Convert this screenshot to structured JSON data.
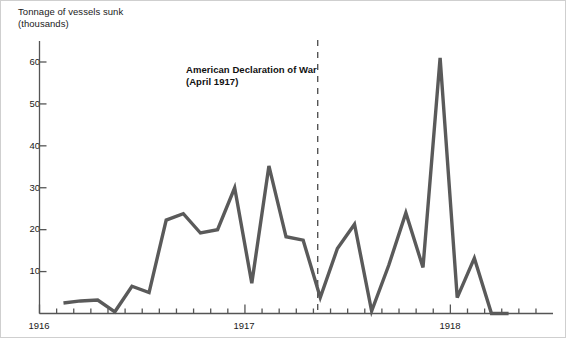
{
  "figure": {
    "width": 566,
    "height": 338,
    "background": "#ffffff",
    "axis_color": "#555555",
    "line_color": "#5a5a5a",
    "text_color": "#1a1a1a",
    "frame_color": "#cfcfcf"
  },
  "axis_title": "Tonnage of vessels sunk\n(thousands)",
  "annotation": {
    "text": "American Declaration of War\n(April 1917)",
    "marker": "dashed-vertical-line",
    "at_x_value": 16.25
  },
  "y_axis": {
    "labels": [
      "60",
      "50",
      "40",
      "30",
      "20",
      "10"
    ],
    "values": [
      60,
      50,
      40,
      30,
      20,
      10
    ]
  },
  "x_axis": {
    "labels": [
      "1916",
      "1917",
      "1918"
    ],
    "values": [
      0,
      12,
      24
    ]
  },
  "chart_data": {
    "type": "line",
    "title": "",
    "xlabel": "",
    "ylabel": "Tonnage of vessels sunk (thousands)",
    "ylim": [
      0,
      65
    ],
    "xlim": [
      0,
      29
    ],
    "grid": false,
    "legend": null,
    "annotations": [
      {
        "label": "American Declaration of War (April 1917)",
        "x": 16.25,
        "style": "dashed vertical line"
      }
    ],
    "x_tick_labels": [
      "1916",
      "1917",
      "1918"
    ],
    "x_tick_values": [
      0,
      12,
      24
    ],
    "y_tick_labels": [
      "10",
      "20",
      "30",
      "40",
      "50",
      "60"
    ],
    "y_tick_values": [
      10,
      20,
      30,
      40,
      50,
      60
    ],
    "series": [
      {
        "name": "Tonnage of vessels sunk (thousands)",
        "x": [
          1.4,
          2.4,
          3.4,
          4.4,
          5.4,
          6.4,
          7.4,
          8.4,
          9.4,
          10.4,
          11.4,
          12.4,
          13.4,
          14.4,
          15.4,
          16.4,
          17.4,
          18.4,
          19.4,
          20.4,
          21.4,
          22.4,
          23.4,
          24.4,
          25.4,
          26.4,
          27.4
        ],
        "values": [
          2.5,
          3.0,
          3.2,
          0.4,
          6.5,
          5.0,
          22.3,
          23.8,
          19.2,
          20.0,
          30.0,
          7.2,
          35.2,
          18.3,
          17.5,
          3.8,
          15.5,
          21.3,
          0.6,
          11.5,
          24.0,
          11.0,
          61.0,
          3.8,
          13.2,
          0.0,
          0.0
        ]
      }
    ]
  }
}
